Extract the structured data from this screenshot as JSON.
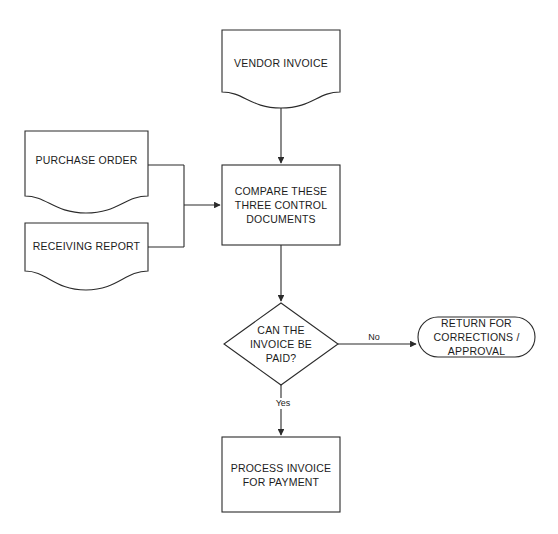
{
  "diagram": {
    "background_color": "#ffffff",
    "line_color": "#2b2b2b",
    "text_color": "#1c1c1c"
  },
  "nodes": {
    "vendor_invoice": {
      "label": "VENDOR INVOICE",
      "shape": "document"
    },
    "purchase_order": {
      "label": "PURCHASE ORDER",
      "shape": "document"
    },
    "receiving_report": {
      "label": "RECEIVING REPORT",
      "shape": "document"
    },
    "compare_documents": {
      "label": "COMPARE THESE\nTHREE CONTROL\nDOCUMENTS",
      "shape": "process"
    },
    "decision": {
      "label": "CAN THE\nINVOICE BE\nPAID?",
      "shape": "decision"
    },
    "return_corrections": {
      "label": "RETURN FOR\nCORRECTIONS /\nAPPROVAL",
      "shape": "terminator"
    },
    "process_invoice": {
      "label": "PROCESS INVOICE\nFOR PAYMENT",
      "shape": "process"
    }
  },
  "edges": {
    "no_label": "No",
    "yes_label": "Yes"
  }
}
